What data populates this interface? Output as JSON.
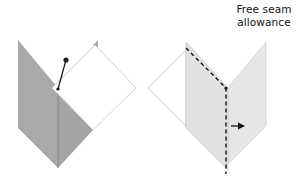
{
  "diagram": {
    "label": {
      "line1": "Free seam",
      "line2": "allowance"
    },
    "colors": {
      "dark_fabric": "#a9a9a9",
      "dark_fabric_edge": "#8f8f8f",
      "light_fabric": "#e6e6e6",
      "light_fabric_edge": "#bdbdbd",
      "white_fabric": "#ffffff",
      "outline": "#c4c4c4",
      "ink": "#111111"
    },
    "figures": [
      {
        "id": "left",
        "description": "Two fabric panels folded along a seam with a pin holding the top square"
      },
      {
        "id": "right",
        "description": "Stitched seam (dashed line) with free seam allowance pressed to the right (arrow)"
      }
    ]
  }
}
